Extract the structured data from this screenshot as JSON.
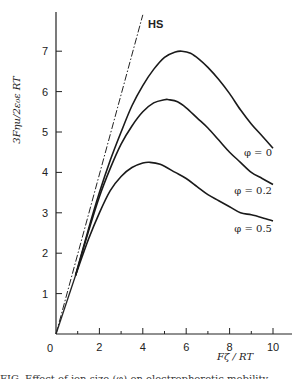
{
  "chart_data": {
    "type": "line",
    "title": "",
    "xlabel": "Fζ / RT",
    "ylabel": "3Fηu/2ε₀ε RT",
    "xlim": [
      0,
      10.8
    ],
    "ylim": [
      0,
      8.0
    ],
    "x_ticks": [
      0,
      2,
      4,
      6,
      8,
      10
    ],
    "x_minor_ticks": [
      1,
      3,
      5,
      7,
      9
    ],
    "y_ticks": [
      1,
      2,
      3,
      4,
      5,
      6,
      7
    ],
    "origin_label": "0",
    "grid": false,
    "legend": "inline labels at right end of curves",
    "reference_line": {
      "name": "HS",
      "style": "dash-dot",
      "x": [
        0,
        4.0
      ],
      "y": [
        0,
        7.9
      ]
    },
    "series": [
      {
        "name": "φ = 0",
        "x": [
          0.9,
          1.5,
          2,
          2.5,
          3,
          3.5,
          4,
          4.5,
          5,
          5.5,
          5.8,
          6.2,
          6.6,
          7,
          7.5,
          8,
          8.5,
          9,
          9.5,
          10
        ],
        "y": [
          1.45,
          2.6,
          3.5,
          4.3,
          5.0,
          5.65,
          6.15,
          6.55,
          6.85,
          6.98,
          7.0,
          6.95,
          6.8,
          6.6,
          6.3,
          5.95,
          5.55,
          5.2,
          4.9,
          4.6
        ]
      },
      {
        "name": "φ = 0.2",
        "x": [
          0.9,
          1.5,
          2,
          2.5,
          3,
          3.5,
          4,
          4.5,
          5,
          5.2,
          5.6,
          6,
          6.5,
          7,
          7.5,
          8,
          8.5,
          9,
          9.5,
          10
        ],
        "y": [
          1.45,
          2.55,
          3.4,
          4.1,
          4.7,
          5.15,
          5.5,
          5.72,
          5.8,
          5.8,
          5.75,
          5.6,
          5.35,
          5.1,
          4.8,
          4.5,
          4.25,
          4.0,
          3.85,
          3.7
        ]
      },
      {
        "name": "φ = 0.5",
        "x": [
          0.9,
          1.5,
          2,
          2.5,
          3,
          3.5,
          4,
          4.3,
          4.8,
          5.5,
          6,
          6.5,
          7,
          7.5,
          8,
          8.5,
          9,
          9.5,
          10
        ],
        "y": [
          1.45,
          2.35,
          3.0,
          3.55,
          3.9,
          4.12,
          4.23,
          4.25,
          4.2,
          4.0,
          3.85,
          3.65,
          3.45,
          3.3,
          3.15,
          3.0,
          2.95,
          2.88,
          2.8
        ]
      }
    ],
    "labels": {
      "hs": "HS",
      "phi0": "φ = 0",
      "phi02": "φ = 0.2",
      "phi05": "φ = 0.5"
    }
  },
  "caption": "FIG. Effect of ion size (φ) on electrophoretic mobility"
}
